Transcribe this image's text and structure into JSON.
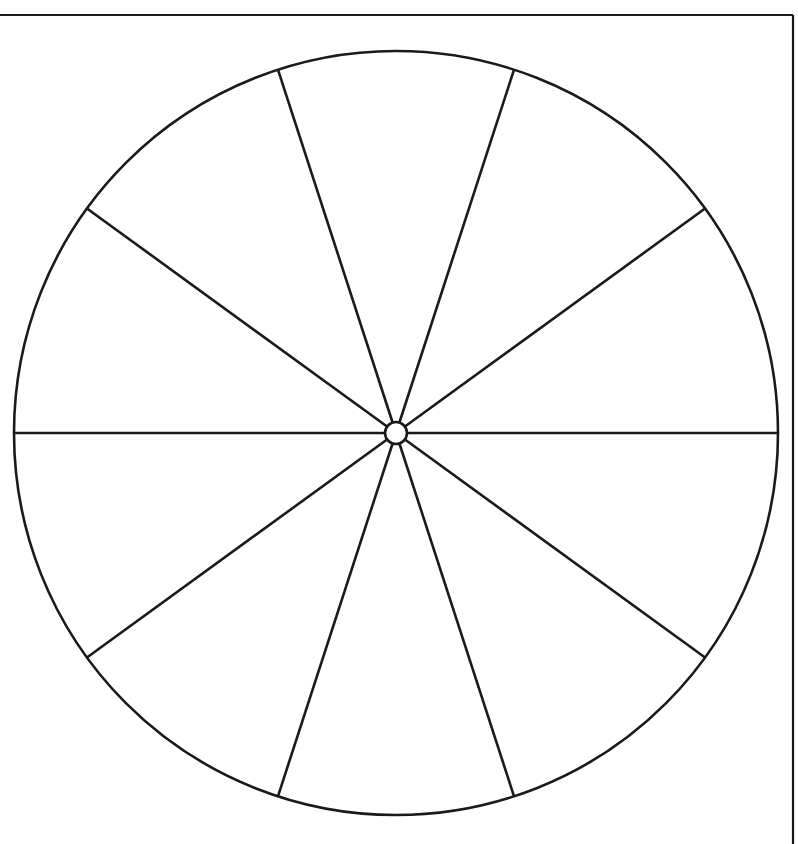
{
  "page": {
    "background_color": "#ffffff",
    "width": 798,
    "height": 844
  },
  "frame": {
    "name": "page-border",
    "stroke_color": "#1a1a1a",
    "stroke_width": 2.2,
    "top_y": 15,
    "right_x": 793,
    "left_x": 0,
    "bottom_y": 844,
    "segments": [
      "top",
      "right"
    ]
  },
  "chart_data": {
    "type": "pie",
    "title": "",
    "subtitle": "",
    "xlabel": "",
    "ylabel": "",
    "legend": [],
    "annotations": [],
    "grid": false,
    "equal_slices": true,
    "slice_count": 10,
    "slice_angle_degrees": 36,
    "values": [
      10,
      10,
      10,
      10,
      10,
      10,
      10,
      10,
      10,
      10
    ],
    "categories": [
      "sector-1",
      "sector-2",
      "sector-3",
      "sector-4",
      "sector-5",
      "sector-6",
      "sector-7",
      "sector-8",
      "sector-9",
      "sector-10"
    ],
    "slice_fill_color": "#ffffff",
    "slice_stroke_color": "#1a1a1a",
    "outer_circle": {
      "center_x": 396,
      "center_y": 433,
      "radius": 382,
      "stroke_width": 2.6,
      "fill": "#ffffff",
      "stroke": "#1a1a1a"
    },
    "hub_circle": {
      "center_x": 396,
      "center_y": 433,
      "radius": 11,
      "stroke_width": 2.6,
      "fill": "#ffffff",
      "stroke": "#1a1a1a"
    },
    "spokes": [
      {
        "name": "spoke-0deg",
        "angle_degrees": 0,
        "end_x": 778,
        "end_y": 433
      },
      {
        "name": "spoke-36deg",
        "angle_degrees": 36,
        "end_x": 705,
        "end_y": 208
      },
      {
        "name": "spoke-72deg",
        "angle_degrees": 72,
        "end_x": 514,
        "end_y": 70
      },
      {
        "name": "spoke-108deg",
        "angle_degrees": 108,
        "end_x": 278,
        "end_y": 70
      },
      {
        "name": "spoke-144deg",
        "angle_degrees": 144,
        "end_x": 87,
        "end_y": 208
      },
      {
        "name": "spoke-180deg",
        "angle_degrees": 180,
        "end_x": 14,
        "end_y": 433
      },
      {
        "name": "spoke-216deg",
        "angle_degrees": 216,
        "end_x": 87,
        "end_y": 658
      },
      {
        "name": "spoke-252deg",
        "angle_degrees": 252,
        "end_x": 278,
        "end_y": 796
      },
      {
        "name": "spoke-288deg",
        "angle_degrees": 288,
        "end_x": 514,
        "end_y": 796
      },
      {
        "name": "spoke-324deg",
        "angle_degrees": 324,
        "end_x": 705,
        "end_y": 658
      }
    ]
  }
}
